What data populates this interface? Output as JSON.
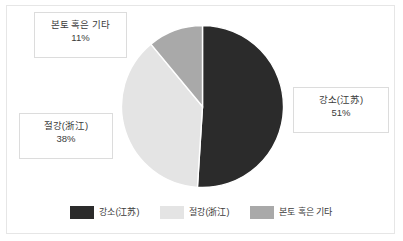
{
  "chart_data": {
    "type": "pie",
    "title": "",
    "categories": [
      "강소(江苏)",
      "절강(浙江)",
      "본토 혹은 기타"
    ],
    "values": [
      51,
      38,
      11
    ],
    "value_labels": [
      "51%",
      "38%",
      "11%"
    ],
    "unit": "%",
    "colors": [
      "#2b2b2b",
      "#e4e4e4",
      "#a9a9a9"
    ],
    "start_angle_deg": 0,
    "direction": "clockwise",
    "legend_position": "bottom",
    "grid": false,
    "xlabel": "",
    "ylabel": ""
  },
  "callouts": [
    {
      "id": "mainland",
      "category": "본토 혹은 기타",
      "percent": "11%"
    },
    {
      "id": "jiangsu",
      "category": "강소(江苏)",
      "percent": "51%"
    },
    {
      "id": "zhejiang",
      "category": "절강(浙江)",
      "percent": "38%"
    }
  ],
  "legend": {
    "items": [
      {
        "label": "강소(江苏)",
        "color": "#2b2b2b"
      },
      {
        "label": "절강(浙江)",
        "color": "#e4e4e4"
      },
      {
        "label": "본토 혹은 기타",
        "color": "#a9a9a9"
      }
    ]
  },
  "frame": {
    "border_color": "#e6e6e6",
    "background": "#ffffff"
  }
}
